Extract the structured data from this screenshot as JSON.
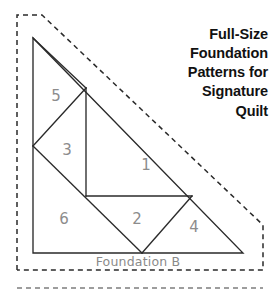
{
  "page": {
    "width": 277,
    "height": 292,
    "background_color": "#ffffff"
  },
  "title": {
    "lines": [
      "Full-Size",
      "Foundation",
      "Patterns for",
      "Signature",
      "Quilt"
    ],
    "align": "right",
    "color": "#111111",
    "weight": "bold"
  },
  "caption": {
    "text": "Foundation B",
    "color": "#8a8a8a"
  },
  "diagram": {
    "type": "foundation-piecing-pattern",
    "shape": "right-triangle",
    "line_color": "#2a2a2a",
    "number_color": "#8c8c8c",
    "seam_allowance_color": "#2a2a2a",
    "outline": {
      "apex": [
        33,
        38
      ],
      "bottom_left": [
        33,
        253
      ],
      "bottom_right": [
        243,
        253
      ]
    },
    "internal_vertices": {
      "top_junction": [
        86,
        88
      ],
      "left_mid": [
        33,
        146
      ],
      "center_low": [
        86,
        196
      ],
      "right_mid": [
        192,
        196
      ],
      "bottom_mid": [
        142,
        253
      ]
    },
    "pieces": [
      {
        "label": "1",
        "x": 146,
        "y": 165
      },
      {
        "label": "2",
        "x": 137,
        "y": 219
      },
      {
        "label": "3",
        "x": 67,
        "y": 150
      },
      {
        "label": "4",
        "x": 194,
        "y": 227
      },
      {
        "label": "5",
        "x": 56,
        "y": 96
      },
      {
        "label": "6",
        "x": 64,
        "y": 219
      }
    ],
    "seam_allowance_border": {
      "style": "dashed",
      "points": [
        [
          17,
          270
        ],
        [
          17,
          15
        ],
        [
          42,
          15
        ],
        [
          263,
          225
        ],
        [
          263,
          270
        ],
        [
          17,
          270
        ]
      ]
    },
    "neighbor_pattern_edge": {
      "style": "dashed",
      "from": [
        17,
        288
      ],
      "to": [
        263,
        288
      ]
    }
  }
}
